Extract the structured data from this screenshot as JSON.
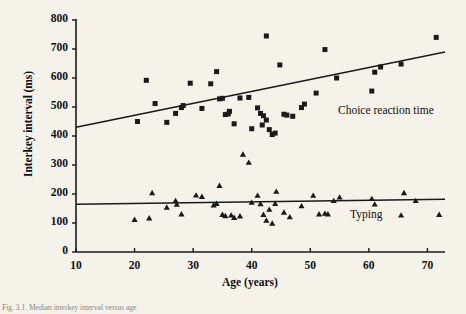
{
  "chart_data": {
    "type": "scatter",
    "title": "",
    "xlabel": "Age (years)",
    "ylabel": "Interkey interval (ms)",
    "xlim": [
      10,
      73
    ],
    "ylim": [
      0,
      800
    ],
    "xticks": [
      10,
      20,
      30,
      40,
      50,
      60,
      70
    ],
    "yticks": [
      0,
      100,
      200,
      300,
      400,
      500,
      600,
      700,
      800
    ],
    "grid": false,
    "legend_position": "inline-annotation",
    "series": [
      {
        "name": "Choice reaction time",
        "marker": "square",
        "color": "#1a1a1a",
        "annotation": "Choice reaction time",
        "trendline": {
          "x": [
            10,
            73
          ],
          "y": [
            430,
            690
          ]
        },
        "points": [
          [
            20.5,
            450
          ],
          [
            22.0,
            592
          ],
          [
            23.5,
            512
          ],
          [
            25.5,
            447
          ],
          [
            27.0,
            478
          ],
          [
            28.0,
            498
          ],
          [
            28.3,
            505
          ],
          [
            29.5,
            582
          ],
          [
            31.5,
            495
          ],
          [
            33.0,
            580
          ],
          [
            34.0,
            622
          ],
          [
            34.5,
            528
          ],
          [
            35.0,
            530
          ],
          [
            35.5,
            474
          ],
          [
            36.0,
            476
          ],
          [
            36.2,
            485
          ],
          [
            37.0,
            442
          ],
          [
            38.0,
            531
          ],
          [
            39.5,
            533
          ],
          [
            40.0,
            425
          ],
          [
            41.0,
            497
          ],
          [
            41.5,
            478
          ],
          [
            41.8,
            438
          ],
          [
            42.0,
            470
          ],
          [
            42.5,
            455
          ],
          [
            42.5,
            745
          ],
          [
            43.0,
            422
          ],
          [
            43.5,
            405
          ],
          [
            44.0,
            410
          ],
          [
            44.8,
            645
          ],
          [
            45.5,
            475
          ],
          [
            46.0,
            472
          ],
          [
            47.0,
            468
          ],
          [
            48.5,
            498
          ],
          [
            49.0,
            510
          ],
          [
            51.0,
            548
          ],
          [
            52.5,
            698
          ],
          [
            54.5,
            600
          ],
          [
            60.5,
            555
          ],
          [
            61.0,
            620
          ],
          [
            62.0,
            638
          ],
          [
            65.5,
            648
          ],
          [
            71.5,
            740
          ]
        ]
      },
      {
        "name": "Typing",
        "marker": "triangle",
        "color": "#1a1a1a",
        "annotation": "Typing",
        "trendline": {
          "x": [
            10,
            73
          ],
          "y": [
            165,
            182
          ]
        },
        "points": [
          [
            20.0,
            113
          ],
          [
            22.5,
            118
          ],
          [
            23.0,
            205
          ],
          [
            25.5,
            155
          ],
          [
            27.0,
            178
          ],
          [
            27.2,
            165
          ],
          [
            28.0,
            132
          ],
          [
            30.5,
            197
          ],
          [
            31.5,
            192
          ],
          [
            33.5,
            163
          ],
          [
            34.0,
            168
          ],
          [
            34.5,
            230
          ],
          [
            35.0,
            130
          ],
          [
            35.5,
            126
          ],
          [
            36.5,
            128
          ],
          [
            37.0,
            120
          ],
          [
            38.0,
            125
          ],
          [
            38.5,
            338
          ],
          [
            39.5,
            310
          ],
          [
            40.0,
            172
          ],
          [
            41.0,
            196
          ],
          [
            41.5,
            167
          ],
          [
            42.0,
            130
          ],
          [
            42.5,
            110
          ],
          [
            43.0,
            148
          ],
          [
            43.5,
            100
          ],
          [
            44.0,
            168
          ],
          [
            44.2,
            210
          ],
          [
            45.5,
            138
          ],
          [
            46.5,
            122
          ],
          [
            48.5,
            160
          ],
          [
            50.5,
            196
          ],
          [
            51.5,
            132
          ],
          [
            52.5,
            134
          ],
          [
            53.0,
            132
          ],
          [
            54.0,
            178
          ],
          [
            55.0,
            190
          ],
          [
            60.5,
            185
          ],
          [
            61.0,
            166
          ],
          [
            65.5,
            128
          ],
          [
            66.0,
            205
          ],
          [
            68.0,
            178
          ],
          [
            72.0,
            130
          ]
        ]
      }
    ]
  },
  "axis": {
    "ytick_labels": [
      "800",
      "700",
      "600",
      "500",
      "400",
      "300",
      "200",
      "100",
      "0"
    ],
    "xtick_labels": [
      "10",
      "20",
      "30",
      "40",
      "50",
      "60",
      "70"
    ]
  },
  "caption": "Fig. 3.1. Median interkey interval versus age"
}
